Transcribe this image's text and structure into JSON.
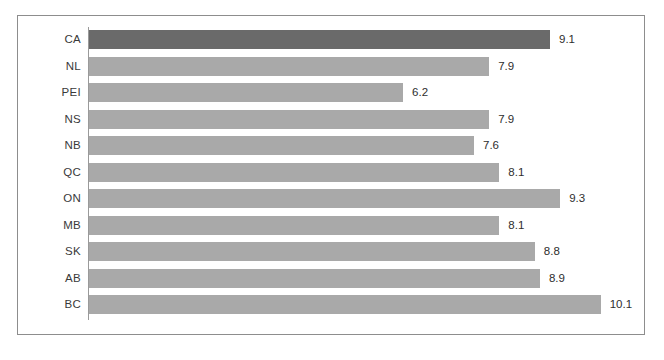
{
  "chart_data": {
    "type": "bar",
    "orientation": "horizontal",
    "title": "",
    "subtitle": "",
    "xlabel": "",
    "ylabel": "",
    "xlim": [
      0,
      10.6
    ],
    "grid": false,
    "legend": false,
    "value_labels": true,
    "highlight_category": "CA",
    "colors": {
      "bar": "#a9a9a9",
      "highlight_bar": "#6a6a6a",
      "axis": "#9a9a9a",
      "frame": "#8d8d8d",
      "label_text": "#3a3a3a",
      "value_text": "#2e2e2e",
      "background": "#ffffff"
    },
    "categories": [
      "CA",
      "NL",
      "PEI",
      "NS",
      "NB",
      "QC",
      "ON",
      "MB",
      "SK",
      "AB",
      "BC"
    ],
    "values": [
      9.1,
      7.9,
      6.2,
      7.9,
      7.6,
      8.1,
      9.3,
      8.1,
      8.8,
      8.9,
      10.1
    ],
    "points": [
      {
        "category": "CA",
        "value": 9.1,
        "label": "9.1",
        "highlight": true
      },
      {
        "category": "NL",
        "value": 7.9,
        "label": "7.9",
        "highlight": false
      },
      {
        "category": "PEI",
        "value": 6.2,
        "label": "6.2",
        "highlight": false
      },
      {
        "category": "NS",
        "value": 7.9,
        "label": "7.9",
        "highlight": false
      },
      {
        "category": "NB",
        "value": 7.6,
        "label": "7.6",
        "highlight": false
      },
      {
        "category": "QC",
        "value": 8.1,
        "label": "8.1",
        "highlight": false
      },
      {
        "category": "ON",
        "value": 9.3,
        "label": "9.3",
        "highlight": false
      },
      {
        "category": "MB",
        "value": 8.1,
        "label": "8.1",
        "highlight": false
      },
      {
        "category": "SK",
        "value": 8.8,
        "label": "8.8",
        "highlight": false
      },
      {
        "category": "AB",
        "value": 8.9,
        "label": "8.9",
        "highlight": false
      },
      {
        "category": "BC",
        "value": 10.1,
        "label": "10.1",
        "highlight": false
      }
    ]
  }
}
